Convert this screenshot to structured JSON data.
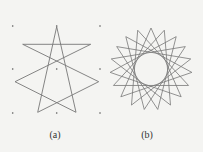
{
  "figure": {
    "panels": [
      {
        "label": "(a)",
        "type": "star-polygon-on-grid",
        "grid_dots": [
          [
            12.7,
            26
          ],
          [
            56.7,
            26
          ],
          [
            100,
            26
          ],
          [
            12.7,
            69
          ],
          [
            56.7,
            69
          ],
          [
            100,
            69
          ],
          [
            12.7,
            113
          ],
          [
            56.7,
            113
          ],
          [
            100,
            113
          ]
        ],
        "vertices_order": [
          [
            56.7,
            26.7
          ],
          [
            76,
            112.3
          ],
          [
            15,
            81.7
          ],
          [
            90.7,
            44.3
          ],
          [
            22.7,
            44.3
          ],
          [
            98.7,
            81.7
          ],
          [
            37.7,
            112.3
          ]
        ],
        "schlafli": "{7/3}"
      },
      {
        "label": "(b)",
        "type": "star-polygon",
        "center": [
          151,
          69
        ],
        "radius": 41,
        "n": 19,
        "k": 7
      }
    ],
    "colors": {
      "line": "#777777",
      "dot": "#555555",
      "background": "#f4f4f2"
    }
  }
}
